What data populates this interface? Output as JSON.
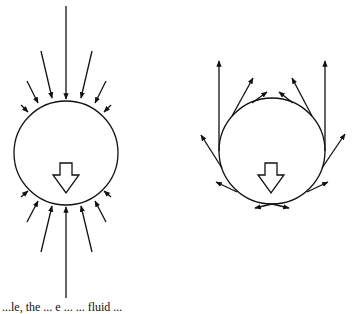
{
  "figure": {
    "left_panel": {
      "label": "inflow-pressure",
      "description": "Circle with arrows pointing inward from all sides; large downward hollow arrow in center",
      "circle": {
        "cx": 66,
        "cy": 153,
        "r": 52
      },
      "inward_arrows_top": 7,
      "inward_arrows_bottom": 7,
      "center_arrow": "down-hollow-arrow"
    },
    "right_panel": {
      "label": "tangential-flow",
      "description": "Circle with tangential arrows along lower half curving up the sides and out at the top; large downward hollow arrow in center",
      "circle": {
        "cx": 272,
        "cy": 151,
        "r": 53
      },
      "tangent_arrows": 10,
      "center_arrow": "down-hollow-arrow"
    },
    "caption": "...le, the ... e ... ... fluid ..."
  },
  "colors": {
    "stroke": "#111111",
    "background": "#ffffff"
  }
}
